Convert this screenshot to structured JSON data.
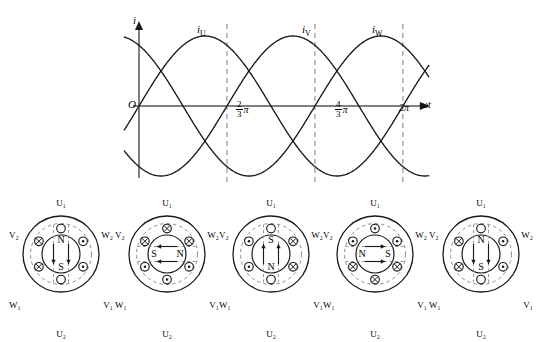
{
  "chart_data": {
    "type": "line",
    "title": "",
    "xlabel": "ωt",
    "ylabel": "i",
    "origin_label": "O",
    "xlim": [
      -0.35,
      6.9
    ],
    "ylim": [
      -1.45,
      1.45
    ],
    "grid": false,
    "legend": "inline curve labels",
    "xticks": [
      {
        "value": 2.0944,
        "label_num": "2",
        "label_den": "3",
        "label_sym": "π",
        "text": "2/3 π"
      },
      {
        "value": 4.18879,
        "label_num": "4",
        "label_den": "3",
        "label_sym": "π",
        "text": "4/3 π"
      },
      {
        "value": 6.28319,
        "label_num": "",
        "label_den": "",
        "label_sym": "2π",
        "text": "2π"
      }
    ],
    "series": [
      {
        "name": "iU",
        "label": "i",
        "sub": "U",
        "phase_deg": 0,
        "amplitude": 1,
        "label_x": 1.7,
        "peak_x": 1.5708
      },
      {
        "name": "iV",
        "label": "i",
        "sub": "V",
        "phase_deg": -120,
        "amplitude": 1,
        "label_x": 3.77,
        "peak_x": 3.665
      },
      {
        "name": "iW",
        "label": "i",
        "sub": "W",
        "phase_deg": 120,
        "amplitude": 1,
        "label_x": 5.1,
        "peak_x": 5.7596
      }
    ],
    "x": [
      0,
      0.2618,
      0.5236,
      0.7854,
      1.0472,
      1.309,
      1.5708,
      1.8326,
      2.0944,
      2.3562,
      2.618,
      2.8798,
      3.1416,
      3.4034,
      3.6652,
      3.927,
      4.1888,
      4.4506,
      4.7124,
      4.9742,
      5.236,
      5.4978,
      5.7596,
      6.0214,
      6.2832,
      6.545,
      6.8068
    ],
    "series_values": {
      "iU": [
        0,
        0.259,
        0.5,
        0.707,
        0.866,
        0.966,
        1,
        0.966,
        0.866,
        0.707,
        0.5,
        0.259,
        0,
        -0.259,
        -0.5,
        -0.707,
        -0.866,
        -0.966,
        -1,
        -0.966,
        -0.866,
        -0.707,
        -0.5,
        -0.259,
        0,
        0.259,
        0.5
      ],
      "iV": [
        -0.866,
        -0.966,
        -1,
        -0.966,
        -0.866,
        -0.707,
        -0.5,
        -0.259,
        0,
        0.259,
        0.5,
        0.707,
        0.866,
        0.966,
        1,
        0.966,
        0.866,
        0.707,
        0.5,
        0.259,
        0,
        -0.259,
        -0.5,
        -0.707,
        -0.866,
        -0.966,
        -1
      ],
      "iW": [
        0.866,
        0.707,
        0.5,
        0.259,
        0,
        -0.259,
        -0.5,
        -0.707,
        -0.866,
        -0.966,
        -1,
        -0.966,
        -0.866,
        -0.707,
        -0.5,
        -0.259,
        0,
        0.259,
        0.5,
        0.707,
        0.866,
        0.966,
        1,
        0.966,
        0.866,
        0.707,
        0.5
      ]
    }
  },
  "motors": {
    "terminal_labels": {
      "top": "U₁",
      "bottom": "U₂",
      "upper_left": "V₂",
      "upper_right": "W₂",
      "lower_left": "W₁",
      "lower_right": "V₁"
    },
    "items": [
      {
        "index": 1,
        "pole_top": "N",
        "pole_bottom": "S",
        "pole_left": "",
        "pole_right": "",
        "field_direction": "down",
        "slots": {
          "top": "empty",
          "bottom": "empty",
          "upper_left": "cross",
          "lower_left": "cross",
          "upper_right": "dot",
          "lower_right": "dot"
        }
      },
      {
        "index": 2,
        "pole_top": "",
        "pole_bottom": "",
        "pole_left": "S",
        "pole_right": "N",
        "field_direction": "left",
        "slots": {
          "top": "cross",
          "bottom": "dot",
          "upper_left": "cross",
          "lower_left": "dot",
          "upper_right": "cross",
          "lower_right": "dot"
        }
      },
      {
        "index": 3,
        "pole_top": "S",
        "pole_bottom": "N",
        "pole_left": "",
        "pole_right": "",
        "field_direction": "up",
        "slots": {
          "top": "empty",
          "bottom": "empty",
          "upper_left": "dot",
          "lower_left": "dot",
          "upper_right": "cross",
          "lower_right": "cross"
        }
      },
      {
        "index": 4,
        "pole_top": "",
        "pole_bottom": "",
        "pole_left": "N",
        "pole_right": "S",
        "field_direction": "right",
        "slots": {
          "top": "dot",
          "bottom": "cross",
          "upper_left": "dot",
          "lower_left": "cross",
          "upper_right": "dot",
          "lower_right": "cross"
        }
      },
      {
        "index": 5,
        "pole_top": "N",
        "pole_bottom": "S",
        "pole_left": "",
        "pole_right": "",
        "field_direction": "down",
        "slots": {
          "top": "empty",
          "bottom": "empty",
          "upper_left": "cross",
          "lower_left": "cross",
          "upper_right": "dot",
          "lower_right": "dot"
        }
      }
    ]
  },
  "colors": {
    "ink": "#1a1a1a",
    "axis": "#808080",
    "dashed": "#8c8c8c",
    "background": "#ffffff"
  }
}
